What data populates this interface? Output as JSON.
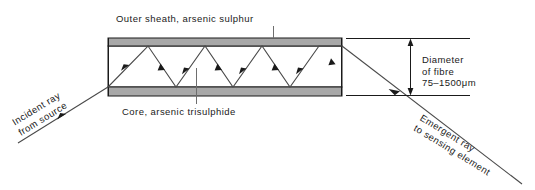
{
  "figure": {
    "title_note": "Optical fibre total internal reflection diagram",
    "labels": {
      "outer_sheath": "Outer sheath, arsenic sulphur",
      "core": "Core, arsenic trisulphide",
      "incident_line1": "Incident ray",
      "incident_line2": "from source",
      "emergent_line1": "Emergent ray",
      "emergent_line2": "to sensing element",
      "dimension_line1": "Diameter",
      "dimension_line2": "of fibre",
      "dimension_line3": "75–1500μm"
    },
    "colors": {
      "sheath_fill": "#a8a8a8",
      "core_fill": "#ffffff",
      "stroke": "#1a1a1a",
      "ray": "#4a4a4a",
      "leader": "#6e6e6e",
      "background": "#ffffff"
    },
    "geometry": {
      "fibre_left": 108,
      "fibre_right": 342,
      "sheath_top_y": 38,
      "core_top_y": 46,
      "core_bottom_y": 87,
      "sheath_bottom_y": 96,
      "dimension_x": 410,
      "ray_top_bounces": [
        148,
        205,
        262,
        319,
        342
      ],
      "ray_bottom_bounces": [
        119,
        176,
        233,
        290
      ],
      "incident_start": [
        18,
        143
      ],
      "emergent_end": [
        522,
        184
      ]
    }
  }
}
